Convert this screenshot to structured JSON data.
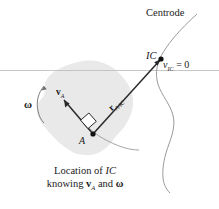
{
  "figure": {
    "background_color": "#ffffff",
    "ink_color": "#1a1a1a",
    "body_fill_color": "#e9e9e9",
    "curve_color": "#8a8a8a",
    "axis_line_color": "#b5b5b5"
  },
  "labels": {
    "centrode": "Centrode",
    "ic": "IC",
    "v_ic_text": "v",
    "v_ic_sub": "IC",
    "v_ic_value": "= 0",
    "omega": "ω",
    "v_a_text": "v",
    "v_a_sub": "A",
    "r_text": "r",
    "r_sub": "A/IC",
    "point_a": "A"
  },
  "caption": {
    "line1_prefix": "Location of ",
    "line1_italic": "IC",
    "line2_prefix": "knowing ",
    "line2_vector": "v",
    "line2_vector_sub": "A",
    "line2_conjunction": " and ",
    "line2_omega": "ω"
  },
  "geometry": {
    "point_a": [
      93,
      134
    ],
    "point_ic": [
      161,
      59
    ],
    "v_a_arrow_tip": [
      64,
      102
    ],
    "horizontal_line_y": 70,
    "right_angle_marker_at": "A"
  }
}
